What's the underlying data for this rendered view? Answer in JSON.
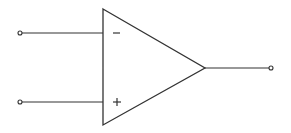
{
  "diagram": {
    "colors": {
      "line": "#333333",
      "background": "#ffffff"
    },
    "component": {
      "type": "op-amp",
      "body": {
        "shape": "triangle",
        "top_vertex": [
          103,
          9
        ],
        "bottom_vertex": [
          103,
          125
        ],
        "apex": [
          205,
          68
        ]
      },
      "inputs": [
        {
          "name": "inverting",
          "symbol": "−",
          "terminal": [
            20,
            33
          ],
          "y": 33
        },
        {
          "name": "non-inverting",
          "symbol": "+",
          "terminal": [
            20,
            102
          ],
          "y": 102
        }
      ],
      "output": {
        "name": "output",
        "terminal": [
          271,
          68
        ],
        "y": 68
      }
    }
  }
}
